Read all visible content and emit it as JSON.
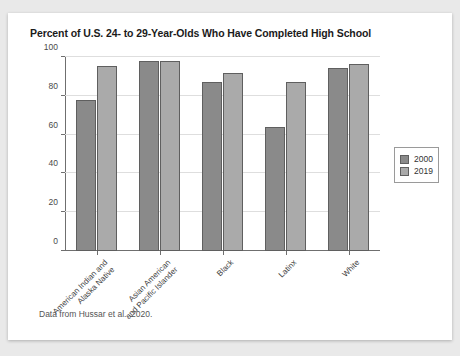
{
  "card": {
    "title": "Percent of U.S. 24- to 29-Year-Olds Who Have Completed High School",
    "source_note": "Data from Hussar et al., 2020."
  },
  "legend": {
    "position": "right",
    "entries": [
      {
        "label": "2000",
        "color": "#8a8a8a"
      },
      {
        "label": "2019",
        "color": "#aaaaaa"
      }
    ]
  },
  "axis": {
    "y_ticks": [
      "0",
      "20",
      "40",
      "60",
      "80",
      "100"
    ]
  },
  "chart_data": {
    "type": "bar",
    "title": "Percent of U.S. 24- to 29-Year-Olds Who Have Completed High School",
    "xlabel": "",
    "ylabel": "",
    "ylim": [
      0,
      100
    ],
    "grid": true,
    "legend_position": "right",
    "categories": [
      "American Indian and Alaska Native",
      "Asian American and Pacific Islander",
      "Black",
      "Latinx",
      "White"
    ],
    "series": [
      {
        "name": "2000",
        "color": "#8a8a8a",
        "values": [
          78,
          98,
          87,
          64,
          94.5
        ]
      },
      {
        "name": "2019",
        "color": "#aaaaaa",
        "values": [
          95.5,
          98,
          92,
          87,
          96.5
        ]
      }
    ],
    "annotations": [
      "Data from Hussar et al., 2020."
    ]
  }
}
